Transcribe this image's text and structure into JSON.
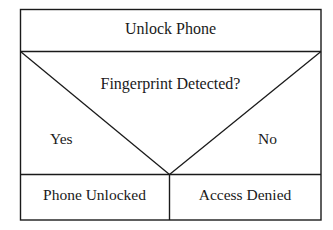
{
  "diagram": {
    "title": "Unlock Phone",
    "decision": {
      "question": "Fingerprint Detected?",
      "yes_label": "Yes",
      "no_label": "No"
    },
    "outcomes": {
      "yes_result": "Phone Unlocked",
      "no_result": "Access Denied"
    },
    "colors": {
      "line": "#1a1a1a",
      "background": "#ffffff",
      "text": "#1a1a1a"
    }
  }
}
